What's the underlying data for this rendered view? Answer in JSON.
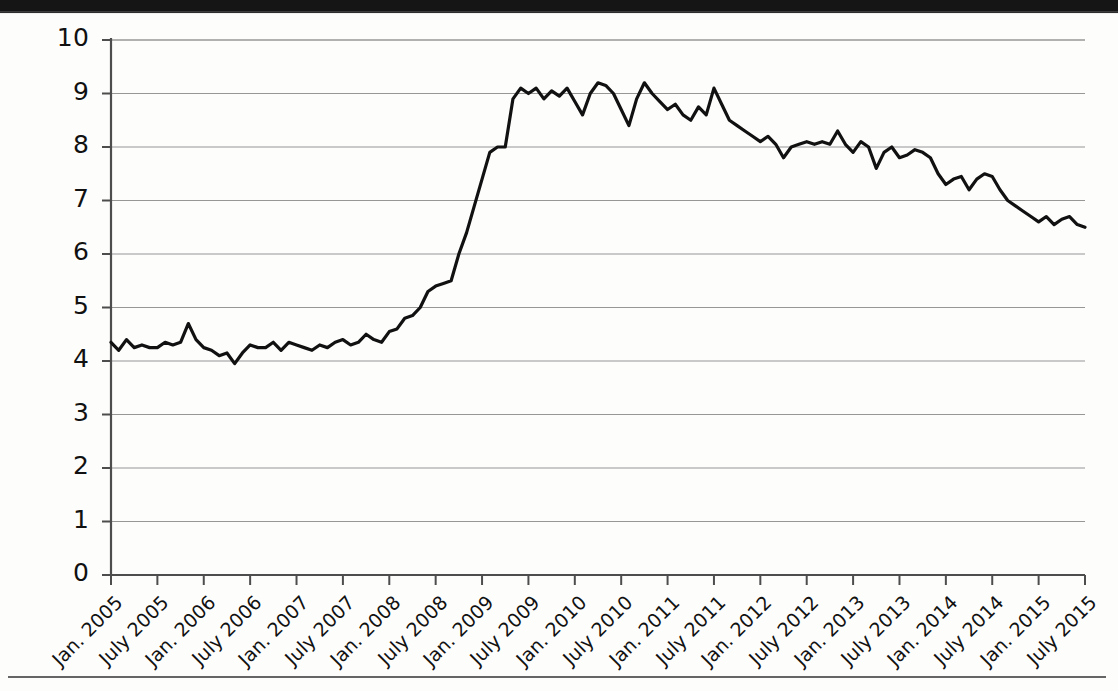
{
  "figure": {
    "kind": "scanned-line-chart",
    "line_color": "#111111",
    "grid_color": "#8c8c8c",
    "axis_color": "#4d4d4d",
    "background": "#fdfdfc"
  },
  "chart_data": {
    "type": "line",
    "title": "",
    "xlabel": "",
    "ylabel": "",
    "ylim": [
      0,
      10
    ],
    "ytick_labels": [
      "0",
      "1",
      "2",
      "3",
      "4",
      "5",
      "6",
      "7",
      "8",
      "9",
      "10"
    ],
    "yticks": [
      0,
      1,
      2,
      3,
      4,
      5,
      6,
      7,
      8,
      9,
      10
    ],
    "grid": true,
    "legend": false,
    "legend_position": "none",
    "xtick_labels": [
      "Jan. 2005",
      "July 2005",
      "Jan. 2006",
      "July 2006",
      "Jan. 2007",
      "July 2007",
      "Jan. 2008",
      "July 2008",
      "Jan. 2009",
      "July 2009",
      "Jan. 2010",
      "July 2010",
      "Jan. 2011",
      "July 2011",
      "Jan. 2012",
      "July 2012",
      "Jan. 2013",
      "July 2013",
      "Jan. 2014",
      "July 2014",
      "Jan. 2015",
      "July 2015"
    ],
    "x_start": "Jan. 2005",
    "x_end": "July 2015",
    "x_interval": "monthly",
    "x_tick_interval_months": 6,
    "x": [
      "Jan. 2005",
      "Feb. 2005",
      "Mar. 2005",
      "Apr. 2005",
      "May 2005",
      "June 2005",
      "July 2005",
      "Aug. 2005",
      "Sept. 2005",
      "Oct. 2005",
      "Nov. 2005",
      "Dec. 2005",
      "Jan. 2006",
      "Feb. 2006",
      "Mar. 2006",
      "Apr. 2006",
      "May 2006",
      "June 2006",
      "July 2006",
      "Aug. 2006",
      "Sept. 2006",
      "Oct. 2006",
      "Nov. 2006",
      "Dec. 2006",
      "Jan. 2007",
      "Feb. 2007",
      "Mar. 2007",
      "Apr. 2007",
      "May 2007",
      "June 2007",
      "July 2007",
      "Aug. 2007",
      "Sept. 2007",
      "Oct. 2007",
      "Nov. 2007",
      "Dec. 2007",
      "Jan. 2008",
      "Feb. 2008",
      "Mar. 2008",
      "Apr. 2008",
      "May 2008",
      "June 2008",
      "July 2008",
      "Aug. 2008",
      "Sept. 2008",
      "Oct. 2008",
      "Nov. 2008",
      "Dec. 2008",
      "Jan. 2009",
      "Feb. 2009",
      "Mar. 2009",
      "Apr. 2009",
      "May 2009",
      "June 2009",
      "July 2009",
      "Aug. 2009",
      "Sept. 2009",
      "Oct. 2009",
      "Nov. 2009",
      "Dec. 2009",
      "Jan. 2010",
      "Feb. 2010",
      "Mar. 2010",
      "Apr. 2010",
      "May 2010",
      "June 2010",
      "July 2010",
      "Aug. 2010",
      "Sept. 2010",
      "Oct. 2010",
      "Nov. 2010",
      "Dec. 2010",
      "Jan. 2011",
      "Feb. 2011",
      "Mar. 2011",
      "Apr. 2011",
      "May 2011",
      "June 2011",
      "July 2011",
      "Aug. 2011",
      "Sept. 2011",
      "Oct. 2011",
      "Nov. 2011",
      "Dec. 2011",
      "Jan. 2012",
      "Feb. 2012",
      "Mar. 2012",
      "Apr. 2012",
      "May 2012",
      "June 2012",
      "July 2012",
      "Aug. 2012",
      "Sept. 2012",
      "Oct. 2012",
      "Nov. 2012",
      "Dec. 2012",
      "Jan. 2013",
      "Feb. 2013",
      "Mar. 2013",
      "Apr. 2013",
      "May 2013",
      "June 2013",
      "July 2013",
      "Aug. 2013",
      "Sept. 2013",
      "Oct. 2013",
      "Nov. 2013",
      "Dec. 2013",
      "Jan. 2014",
      "Feb. 2014",
      "Mar. 2014",
      "Apr. 2014",
      "May 2014",
      "June 2014",
      "July 2014",
      "Aug. 2014",
      "Sept. 2014",
      "Oct. 2014",
      "Nov. 2014",
      "Dec. 2014",
      "Jan. 2015",
      "Feb. 2015",
      "Mar. 2015",
      "Apr. 2015",
      "May 2015",
      "June 2015",
      "July 2015"
    ],
    "values": [
      4.35,
      4.2,
      4.4,
      4.25,
      4.3,
      4.25,
      4.25,
      4.35,
      4.3,
      4.35,
      4.7,
      4.4,
      4.25,
      4.2,
      4.1,
      4.15,
      3.95,
      4.15,
      4.3,
      4.25,
      4.25,
      4.35,
      4.2,
      4.35,
      4.3,
      4.25,
      4.2,
      4.3,
      4.25,
      4.35,
      4.4,
      4.3,
      4.35,
      4.5,
      4.4,
      4.35,
      4.55,
      4.6,
      4.8,
      4.85,
      5.0,
      5.3,
      5.4,
      5.45,
      5.5,
      6.0,
      6.4,
      6.9,
      7.4,
      7.9,
      8.0,
      8.0,
      8.9,
      9.1,
      9.0,
      9.1,
      8.9,
      9.05,
      8.95,
      9.1,
      8.85,
      8.6,
      9.0,
      9.2,
      9.15,
      9.0,
      8.7,
      8.4,
      8.9,
      9.2,
      9.0,
      8.85,
      8.7,
      8.8,
      8.6,
      8.5,
      8.75,
      8.6,
      9.1,
      8.8,
      8.5,
      8.4,
      8.3,
      8.2,
      8.1,
      8.2,
      8.05,
      7.8,
      8.0,
      8.05,
      8.1,
      8.05,
      8.1,
      8.05,
      8.3,
      8.05,
      7.9,
      8.1,
      8.0,
      7.6,
      7.9,
      8.0,
      7.8,
      7.85,
      7.95,
      7.9,
      7.8,
      7.5,
      7.3,
      7.4,
      7.45,
      7.2,
      7.4,
      7.5,
      7.45,
      7.2,
      7.0,
      6.9,
      6.8,
      6.7,
      6.6,
      6.7,
      6.55,
      6.65,
      6.7,
      6.55,
      6.5
    ],
    "notes": {
      "minimum_value": 3.95,
      "maximum_value": 9.2,
      "first_value": 4.35,
      "last_value": 6.5
    }
  }
}
